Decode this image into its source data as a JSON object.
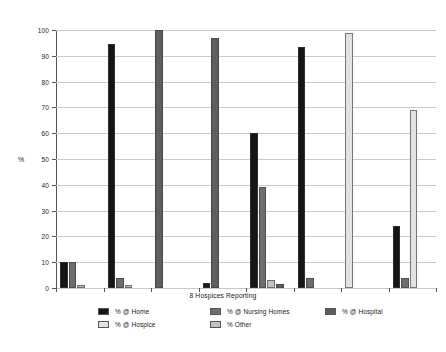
{
  "chart_data": {
    "type": "bar",
    "title": "",
    "xlabel": "8 Hospices Reporting",
    "ylabel": "%",
    "ylim": [
      0,
      100
    ],
    "ytick_labels": [
      "0",
      "10",
      "20",
      "30",
      "40",
      "50",
      "60",
      "70",
      "80",
      "90",
      "100"
    ],
    "ytick_values": [
      0,
      10,
      20,
      30,
      40,
      50,
      60,
      70,
      80,
      90,
      100
    ],
    "grid": true,
    "legend_position": "bottom",
    "categories": [
      "1",
      "2",
      "3",
      "4",
      "5",
      "6",
      "7",
      "8"
    ],
    "series": [
      {
        "name": "% @ Home",
        "color": "#151515",
        "values": [
          10,
          94.5,
          0,
          2,
          60,
          93.5,
          0,
          24
        ]
      },
      {
        "name": "% @ Hospice",
        "color": "#e2e2e2",
        "values": [
          0,
          0,
          0,
          0,
          0,
          0,
          99,
          69
        ]
      },
      {
        "name": "% @ Nursing Homes",
        "color": "#6e6e6e",
        "values": [
          10,
          4,
          0,
          0,
          39,
          4,
          0,
          4
        ]
      },
      {
        "name": "% Other",
        "color": "#c2c2c2",
        "values": [
          1,
          1,
          0,
          0,
          3,
          0,
          0,
          0
        ]
      },
      {
        "name": "% @ Hospital",
        "color": "#5e5e5e",
        "values": [
          0,
          0,
          100,
          97,
          1.5,
          0,
          0,
          0
        ]
      }
    ]
  },
  "legend": {
    "columns": [
      {
        "left_px": 98,
        "entries": [
          {
            "label": "% @ Home",
            "color": "#151515"
          },
          {
            "label": "% @ Hospice",
            "color": "#e2e2e2"
          }
        ]
      },
      {
        "left_px": 210,
        "entries": [
          {
            "label": "% @ Nursing Homes",
            "color": "#6e6e6e"
          },
          {
            "label": "% Other",
            "color": "#c2c2c2"
          }
        ]
      },
      {
        "left_px": 325,
        "entries": [
          {
            "label": "% @ Hospital",
            "color": "#5e5e5e"
          }
        ]
      }
    ]
  }
}
